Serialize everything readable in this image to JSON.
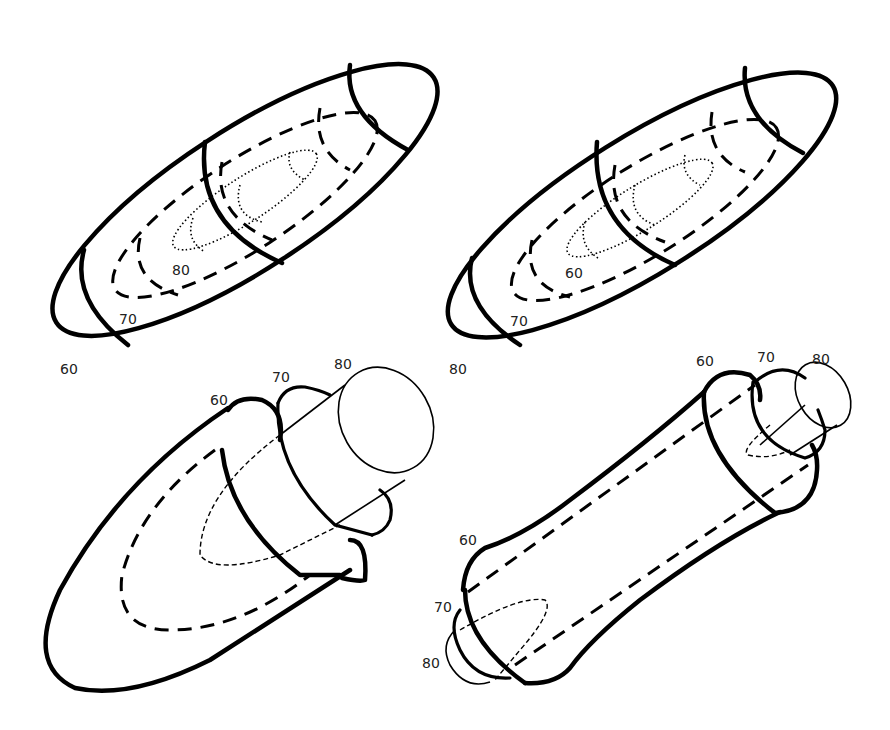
{
  "panels": [
    {
      "id": "top-left",
      "shape": "nested ellipsoids (elongated)",
      "labels": [
        {
          "text": "60",
          "x": 60,
          "y": 362
        },
        {
          "text": "70",
          "x": 119,
          "y": 312
        },
        {
          "text": "80",
          "x": 172,
          "y": 263
        }
      ],
      "line_styles": {
        "60": "solid",
        "70": "dashed",
        "80": "dotted"
      }
    },
    {
      "id": "top-right",
      "shape": "nested ellipsoids (elongated)",
      "labels": [
        {
          "text": "80",
          "x": 449,
          "y": 362
        },
        {
          "text": "70",
          "x": 510,
          "y": 314
        },
        {
          "text": "60",
          "x": 565,
          "y": 266
        }
      ],
      "line_styles": {
        "80": "solid",
        "70": "dashed",
        "60": "dotted"
      }
    },
    {
      "id": "bottom-left",
      "shape": "ellipsoid with stacked cylinders",
      "labels": [
        {
          "text": "60",
          "x": 210,
          "y": 393
        },
        {
          "text": "70",
          "x": 272,
          "y": 370
        },
        {
          "text": "80",
          "x": 334,
          "y": 357
        }
      ]
    },
    {
      "id": "bottom-right",
      "shape": "cylinder with stepped ends",
      "labels": [
        {
          "text": "60",
          "x": 696,
          "y": 354
        },
        {
          "text": "70",
          "x": 757,
          "y": 350
        },
        {
          "text": "80",
          "x": 812,
          "y": 352
        },
        {
          "text": "60",
          "x": 459,
          "y": 533
        },
        {
          "text": "70",
          "x": 434,
          "y": 600
        },
        {
          "text": "80",
          "x": 422,
          "y": 656
        }
      ]
    }
  ]
}
